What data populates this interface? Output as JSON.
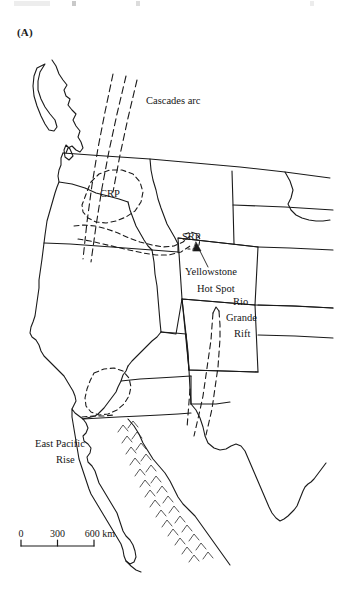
{
  "figure": {
    "panel_label": "(A)",
    "background_color": "#ffffff",
    "line_color": "#1a1a1a"
  },
  "labels": {
    "cascades_arc": "Cascades arc",
    "crp": "CRP",
    "srp": "SRP",
    "yellowstone_line1": "Yellowstone",
    "yellowstone_line2": "Hot Spot",
    "rio_line1": "Rio",
    "rio_line2": "Grande",
    "rio_line3": "Rift",
    "epr_line1": "East Pacific",
    "epr_line2": "Rise"
  },
  "scale_bar": {
    "tick_0": "0",
    "tick_300": "300",
    "tick_600": "600 km",
    "ticks": [
      0,
      300,
      600
    ],
    "unit": "km"
  }
}
